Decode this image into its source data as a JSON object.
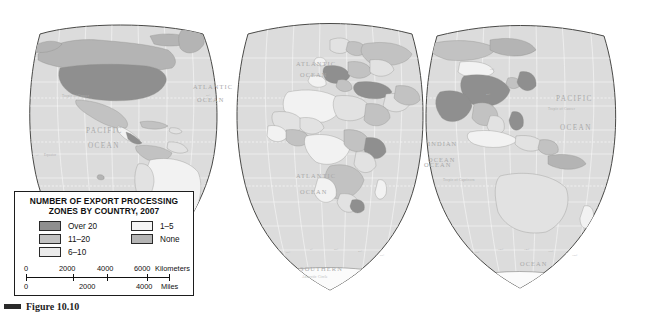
{
  "figure": {
    "caption": "Figure 10.10",
    "caption_bar_color": "#2a2a2a"
  },
  "map": {
    "projection_name": "interrupted-goode-homolosine",
    "background_color": "#ffffff",
    "land_base_color": "#dcdcdc",
    "outline_color": "#4a4a48",
    "graticule_color": "#ffffff",
    "ocean_labels": [
      {
        "text": "PACIFIC",
        "x": 86,
        "y": 133
      },
      {
        "text": "OCEAN",
        "x": 88,
        "y": 148
      },
      {
        "text": "ATLANTIC",
        "x": 196,
        "y": 89
      },
      {
        "text": "OCEAN",
        "x": 200,
        "y": 104
      },
      {
        "text": "ATLANTIC",
        "x": 301,
        "y": 66
      },
      {
        "text": "OCEAN",
        "x": 305,
        "y": 76
      },
      {
        "text": "ATLANTIC",
        "x": 300,
        "y": 177
      },
      {
        "text": "OCEAN",
        "x": 303,
        "y": 193
      },
      {
        "text": "INDIAN",
        "x": 430,
        "y": 145
      },
      {
        "text": "OCEAN",
        "x": 432,
        "y": 161
      },
      {
        "text": "PACIFIC",
        "x": 560,
        "y": 100
      },
      {
        "text": "OCEAN",
        "x": 566,
        "y": 130
      },
      {
        "text": "OCEAN",
        "x": 437,
        "y": 166
      },
      {
        "text": "SOUTHERN",
        "x": 316,
        "y": 270
      },
      {
        "text": "OCEAN",
        "x": 527,
        "y": 265
      }
    ],
    "line_labels": [
      {
        "text": "Tropic of Cancer",
        "x": 74,
        "y": 97
      },
      {
        "text": "Equator",
        "x": 60,
        "y": 156
      },
      {
        "text": "Tropic of Capricorn",
        "x": 455,
        "y": 180
      },
      {
        "text": "Tropic of Cancer",
        "x": 556,
        "y": 110
      },
      {
        "text": "Antarctic Circle",
        "x": 318,
        "y": 277
      }
    ],
    "graticule_numbers": [
      "60°",
      "40°",
      "20°",
      "0°",
      "20°",
      "40°",
      "60°",
      "80°",
      "100°",
      "120°",
      "140°",
      "160°"
    ]
  },
  "legend": {
    "title_line1": "NUMBER OF EXPORT PROCESSING",
    "title_line2": "ZONES BY COUNTRY, 2007",
    "classes": [
      {
        "label": "Over 20",
        "color": "#8f8f8f",
        "swatch": "sw-over20"
      },
      {
        "label": "11–20",
        "color": "#c2c2c2",
        "swatch": "sw-11-20"
      },
      {
        "label": "6–10",
        "color": "#ebebeb",
        "swatch": "sw-6-10"
      },
      {
        "label": "1–5",
        "color": "#f5f5f5",
        "swatch": "sw-1-5"
      },
      {
        "label": "None",
        "color": "#b4b4b4",
        "swatch": "sw-none"
      }
    ],
    "scale": {
      "km_ticks": [
        "0",
        "2000",
        "4000",
        "6000"
      ],
      "km_unit": "Kilometers",
      "mi_ticks": [
        "0",
        "2000",
        "4000"
      ],
      "mi_unit": "Miles"
    }
  }
}
